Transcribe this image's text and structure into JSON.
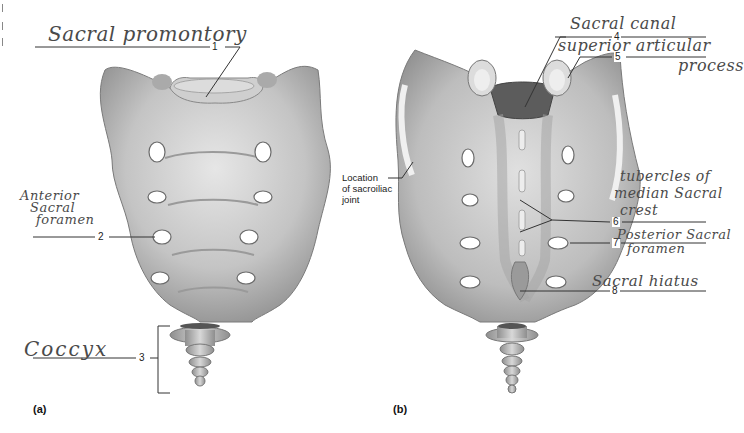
{
  "figure": {
    "panels": [
      {
        "id": "a",
        "label": "(a)",
        "view": "anterior"
      },
      {
        "id": "b",
        "label": "(b)",
        "view": "posterior"
      }
    ]
  },
  "labels": {
    "l1": {
      "number": "1",
      "text": "Sacral promontory"
    },
    "l2": {
      "number": "2",
      "text_lines": [
        "Anterior",
        "Sacral",
        "foramen"
      ]
    },
    "l3": {
      "number": "3",
      "text": "Coccyx"
    },
    "l4": {
      "number": "4",
      "text": "Sacral canal"
    },
    "l5": {
      "number": "5",
      "text_lines": [
        "superior articular",
        "process"
      ]
    },
    "l6": {
      "number": "6",
      "text_lines": [
        "tubercles of",
        "median Sacral",
        "crest"
      ]
    },
    "l7": {
      "number": "7",
      "text_lines": [
        "Posterior Sacral",
        "foramen"
      ]
    },
    "l8": {
      "number": "8",
      "text": "Sacral hiatus"
    }
  },
  "printed_labels": {
    "sacroiliac_lines": [
      "Location",
      "of sacroiliac",
      "joint"
    ]
  },
  "colors": {
    "bone_light": "#d9d9d9",
    "bone_mid": "#b3b3b3",
    "bone_dark": "#8a8a8a",
    "leader_line": "#333333",
    "handwriting": "#4a4a4a"
  }
}
